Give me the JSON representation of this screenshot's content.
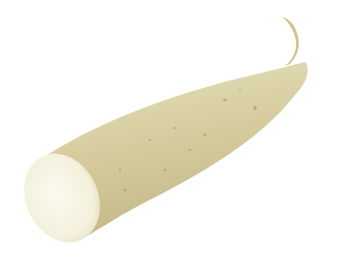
{
  "image": {
    "subject": "Cut white root vegetable (daikon / yam) on white background",
    "background_color": "#ffffff",
    "colors": {
      "skin_light": "#e4dfb8",
      "skin_mid": "#d6cc9c",
      "skin_dark": "#bfb27e",
      "spot": "#a88a5c",
      "cut_face": "#f7f5e6",
      "cut_face_edge": "#ebe7cc",
      "tip": "#cfc08c"
    }
  }
}
